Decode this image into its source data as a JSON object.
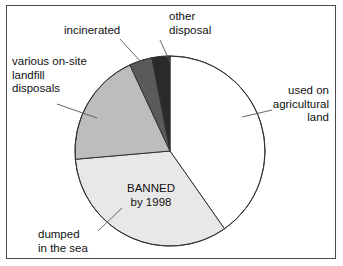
{
  "figure": {
    "background_color": "#ffffff",
    "frame_color": "#4a4a4a"
  },
  "labels": {
    "incinerated": "incinerated",
    "other_disposal": "other\ndisposal",
    "landfill": "various on-site\nlandfill\ndisposals",
    "agricultural": "used on\nagricultural\nland",
    "dumped": "dumped\nin the sea",
    "banned": "BANNED\nby 1998"
  },
  "chart_data": {
    "type": "pie",
    "title": "",
    "legend_position": "callout-labels",
    "grid": false,
    "start_angle_deg": 0,
    "direction": "clockwise",
    "center": [
      170,
      151
    ],
    "radius": 95,
    "categories": [
      "used on agricultural land",
      "dumped in the sea",
      "various on-site landfill disposals",
      "incinerated",
      "other disposal"
    ],
    "values": [
      40,
      33,
      19,
      4,
      4
    ],
    "unit": "percent",
    "colors": [
      "#ffffff",
      "#e8e8e8",
      "#bdbdbd",
      "#5a5a5a",
      "#2a2a2a"
    ],
    "slice_edge_color": "#333333",
    "annotations": [
      {
        "text": "BANNED by 1998",
        "attached_to": "dumped in the sea"
      }
    ],
    "slices": [
      {
        "label": "used on agricultural land",
        "value": 40,
        "start_deg": 0,
        "end_deg": 145,
        "color": "#ffffff"
      },
      {
        "label": "dumped in the sea",
        "value": 33,
        "start_deg": 145,
        "end_deg": 265,
        "color": "#e8e8e8"
      },
      {
        "label": "various on-site landfill disposals",
        "value": 19,
        "start_deg": 265,
        "end_deg": 335,
        "color": "#bdbdbd"
      },
      {
        "label": "incinerated",
        "value": 4,
        "start_deg": 335,
        "end_deg": 349,
        "color": "#5a5a5a"
      },
      {
        "label": "other disposal",
        "value": 4,
        "start_deg": 349,
        "end_deg": 360,
        "color": "#2a2a2a"
      }
    ],
    "leader_lines": [
      {
        "label": "incinerated",
        "from": [
          120,
          39
        ],
        "to": [
          151,
          73
        ]
      },
      {
        "label": "other disposal",
        "from": [
          160,
          40
        ],
        "to": [
          170,
          62
        ]
      },
      {
        "label": "various on-site landfill disposals",
        "from": [
          57,
          104
        ],
        "to": [
          97,
          118
        ]
      },
      {
        "label": "used on agricultural land",
        "from": [
          272,
          110
        ],
        "to": [
          242,
          117
        ]
      },
      {
        "label": "dumped in the sea",
        "from": [
          98,
          231
        ],
        "to": [
          122,
          208
        ]
      }
    ]
  }
}
